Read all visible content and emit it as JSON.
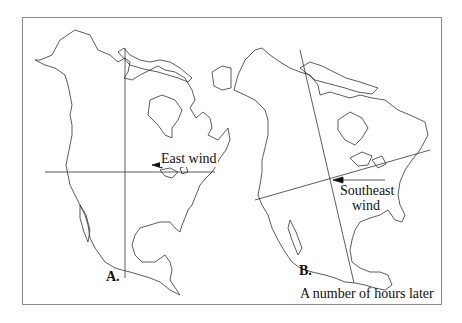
{
  "figure": {
    "panels": [
      {
        "id": "A",
        "label": "A.",
        "wind_label": "East wind",
        "wind_direction": "east"
      },
      {
        "id": "B",
        "label": "B.",
        "wind_label_line1": "Southeast",
        "wind_label_line2": "wind",
        "wind_direction": "southeast",
        "caption": "A number of hours later"
      }
    ],
    "colors": {
      "stroke": "#333333",
      "border": "#8a8a8a",
      "text": "#111111"
    }
  }
}
